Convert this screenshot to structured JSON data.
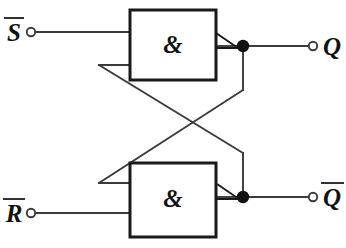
{
  "diagram": {
    "type": "logic-circuit",
    "background_color": "#ffffff",
    "wire_color": "#3a3a3a",
    "ink_color": "#1a1a1a",
    "gate_border_color": "#1a1a1a"
  },
  "gates": [
    {
      "id": "gate-top",
      "symbol": "&",
      "function": "NAND",
      "inputs": [
        "S-bar",
        "Q-bar-feedback"
      ],
      "output": "Q"
    },
    {
      "id": "gate-bottom",
      "symbol": "&",
      "function": "NAND",
      "inputs": [
        "Q-feedback",
        "R-bar"
      ],
      "output": "Q-bar"
    }
  ],
  "ports": {
    "input_s": {
      "label": "S",
      "overline": true,
      "kind": "input-terminal"
    },
    "input_r": {
      "label": "R",
      "overline": true,
      "kind": "input-terminal"
    },
    "output_q": {
      "label": "Q",
      "overline": false,
      "kind": "output-terminal"
    },
    "output_qbar": {
      "label": "Q",
      "overline": true,
      "kind": "output-terminal"
    }
  },
  "nodes": [
    {
      "id": "junction-q",
      "kind": "wire-junction-dot"
    },
    {
      "id": "junction-qbar",
      "kind": "wire-junction-dot"
    }
  ]
}
